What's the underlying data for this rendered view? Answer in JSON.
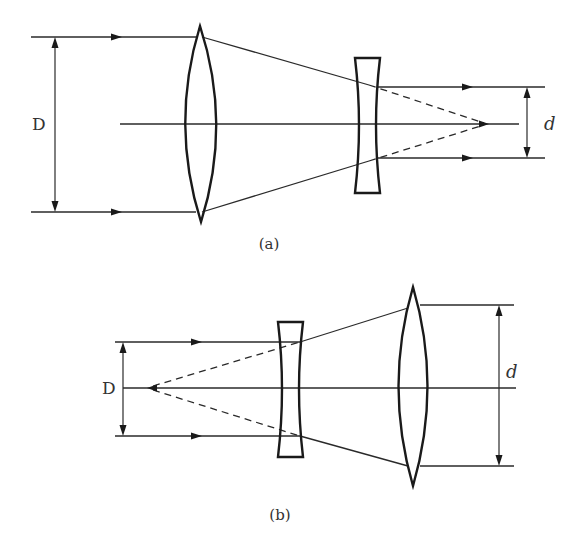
{
  "figure": {
    "colors": {
      "line": "#2a2a2a",
      "lens": "#1a1a1a",
      "text": "#333333",
      "background": "#ffffff"
    }
  },
  "diagram_a": {
    "caption": "(a)",
    "input_diameter_label": "D",
    "output_diameter_label": "d",
    "elements": [
      "converging lens (biconvex)",
      "diverging lens (biconcave)"
    ],
    "description": "Wide beam of diameter D enters biconvex lens, converges, then biconcave lens re-collimates to narrower beam d; dashed lines show virtual convergence to focal point"
  },
  "diagram_b": {
    "caption": "(b)",
    "input_diameter_label": "D",
    "output_diameter_label": "d",
    "elements": [
      "diverging lens (biconcave)",
      "converging lens (biconvex)"
    ],
    "description": "Narrow beam of diameter D enters biconcave lens, diverges (dashed lines trace back to virtual focal point), then biconvex lens re-collimates to wider beam d"
  }
}
